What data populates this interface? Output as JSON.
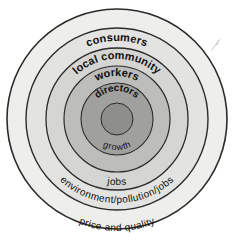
{
  "diagram": {
    "type": "concentric-rings",
    "background_color": "#ffffff",
    "outline_color": "#2b2b2b",
    "rings": [
      {
        "id": "ring-price-and-quality",
        "label": "price and quality",
        "level": 1,
        "radius": 113,
        "fill": "#eeeeec",
        "text_style": "light",
        "text_size": 10,
        "label_position": "bottom-arc"
      },
      {
        "id": "ring-consumers",
        "label": "consumers",
        "level": 2,
        "radius": 91,
        "fill": "#e3e3e1",
        "text_style": "bold",
        "text_size": 11,
        "label_position": "top-arc"
      },
      {
        "id": "ring-environment-pollution-jobs",
        "label": "environment/pollution/jobs",
        "level": 2,
        "radius": 91,
        "fill": "#e3e3e1",
        "text_style": "light",
        "text_size": 10,
        "label_position": "bottom-arc"
      },
      {
        "id": "ring-local-community",
        "label": "local community",
        "level": 3,
        "radius": 71,
        "fill": "#d5d5d3",
        "text_style": "bold",
        "text_size": 11,
        "label_position": "top-arc"
      },
      {
        "id": "ring-jobs",
        "label": "jobs",
        "level": 3,
        "radius": 71,
        "fill": "#d5d5d3",
        "text_style": "light",
        "text_size": 10,
        "label_position": "bottom-arc"
      },
      {
        "id": "ring-workers",
        "label": "workers",
        "level": 4,
        "radius": 53,
        "fill": "#bdbdbb",
        "text_style": "bold",
        "text_size": 11,
        "label_position": "top-arc"
      },
      {
        "id": "ring-directors",
        "label": "directors",
        "level": 5,
        "radius": 36,
        "fill": "#a0a09e",
        "text_style": "bold",
        "text_size": 10,
        "label_position": "top-arc"
      },
      {
        "id": "ring-growth",
        "label": "growth",
        "level": 5,
        "radius": 36,
        "fill": "#a0a09e",
        "text_style": "light",
        "text_size": 9,
        "label_position": "bottom-arc"
      },
      {
        "id": "core-disc",
        "label": "",
        "level": 6,
        "radius": 16,
        "fill": "#8e8e8c",
        "text_style": "none",
        "text_size": 0,
        "label_position": "none"
      }
    ],
    "artifacts": [
      {
        "id": "stray-pencil-mark",
        "description": "faint stray pencil stroke outside the outer circle, upper right"
      }
    ]
  }
}
